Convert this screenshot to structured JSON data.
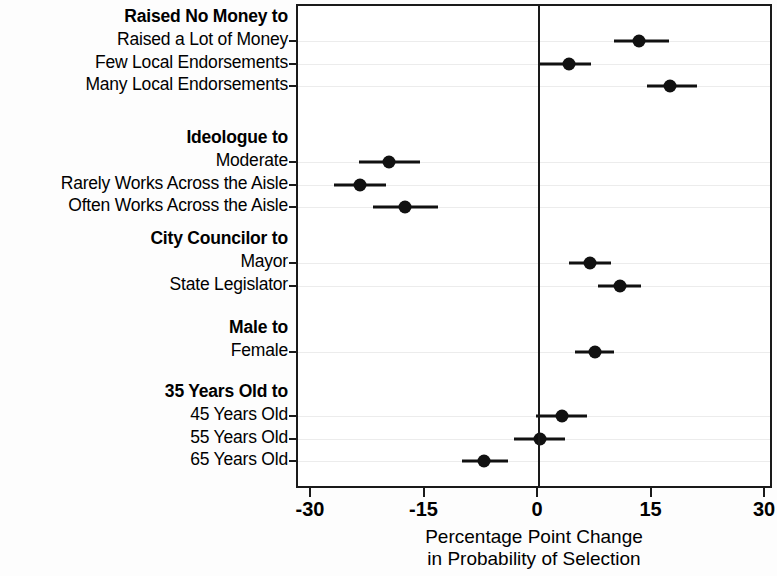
{
  "chart_data": {
    "type": "scatter",
    "title": "",
    "xlabel": "Percentage Point Change\nin Probability of Selection",
    "ylabel": "",
    "xlim": [
      -30,
      30
    ],
    "xticks": [
      -30,
      -15,
      0,
      15,
      30
    ],
    "xticklabels": [
      "-30",
      "-15",
      "0",
      "15",
      "30"
    ],
    "grid": true,
    "reference_line": 0,
    "marker_color": "#111111",
    "frame_color": "#1a1a1a",
    "gridline_color": "#ececec",
    "groups": [
      {
        "header": "Raised No Money to",
        "rows": [
          {
            "label": "Raised a Lot of Money",
            "estimate": 13.2,
            "ci_low": 9.9,
            "ci_high": 17.2
          },
          {
            "label": "Few Local Endorsements",
            "estimate": 4.0,
            "ci_low": 0.0,
            "ci_high": 6.9
          },
          {
            "label": "Many Local Endorsements",
            "estimate": 17.3,
            "ci_low": 14.3,
            "ci_high": 20.9
          }
        ]
      },
      {
        "header": "Ideologue to",
        "rows": [
          {
            "label": "Moderate",
            "estimate": -19.8,
            "ci_low": -23.8,
            "ci_high": -15.7
          },
          {
            "label": "Rarely Works Across the Aisle",
            "estimate": -23.6,
            "ci_low": -27.1,
            "ci_high": -20.2
          },
          {
            "label": "Often Works Across the Aisle",
            "estimate": -17.7,
            "ci_low": -21.9,
            "ci_high": -13.3
          }
        ]
      },
      {
        "header": "City Councilor to",
        "rows": [
          {
            "label": "Mayor",
            "estimate": 6.7,
            "ci_low": 4.0,
            "ci_high": 9.5
          },
          {
            "label": "State Legislator",
            "estimate": 10.7,
            "ci_low": 7.8,
            "ci_high": 13.5
          }
        ]
      },
      {
        "header": "Male to",
        "rows": [
          {
            "label": "Female",
            "estimate": 7.4,
            "ci_low": 4.8,
            "ci_high": 9.9
          }
        ]
      },
      {
        "header": "35 Years Old to",
        "rows": [
          {
            "label": "45 Years Old",
            "estimate": 3.0,
            "ci_low": -0.4,
            "ci_high": 6.3
          },
          {
            "label": "55 Years Old",
            "estimate": 0.1,
            "ci_low": -3.3,
            "ci_high": 3.4
          },
          {
            "label": "65 Years Old",
            "estimate": -7.3,
            "ci_low": -10.2,
            "ci_high": -4.1
          }
        ]
      }
    ]
  }
}
